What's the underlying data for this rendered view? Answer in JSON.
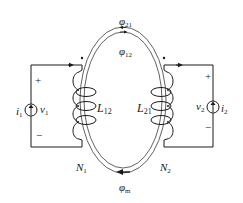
{
  "diagram": {
    "type": "magnetically coupled coils on a toroidal core",
    "colors": {
      "line": "#1a1a1a",
      "core": "#3a3a3a",
      "background": "#ffffff"
    },
    "flux_labels": {
      "phi21": {
        "symbol": "φ",
        "sub": "21"
      },
      "phi12": {
        "symbol": "φ",
        "sub": "12"
      },
      "phim": {
        "symbol": "φ",
        "sub": "m"
      }
    },
    "left_circuit": {
      "current": {
        "symbol": "i",
        "sub": "1"
      },
      "voltage": {
        "symbol": "v",
        "sub": "1"
      },
      "plus": "+",
      "minus": "−",
      "inductance": {
        "symbol": "L",
        "sub": "12"
      },
      "turns": {
        "symbol": "N",
        "sub": "1"
      },
      "dot": "•"
    },
    "right_circuit": {
      "current": {
        "symbol": "i",
        "sub": "2"
      },
      "voltage": {
        "symbol": "v",
        "sub": "2"
      },
      "plus": "+",
      "minus": "−",
      "inductance": {
        "symbol": "L",
        "sub": "21"
      },
      "turns": {
        "symbol": "N",
        "sub": "2"
      },
      "dot": "•"
    }
  }
}
